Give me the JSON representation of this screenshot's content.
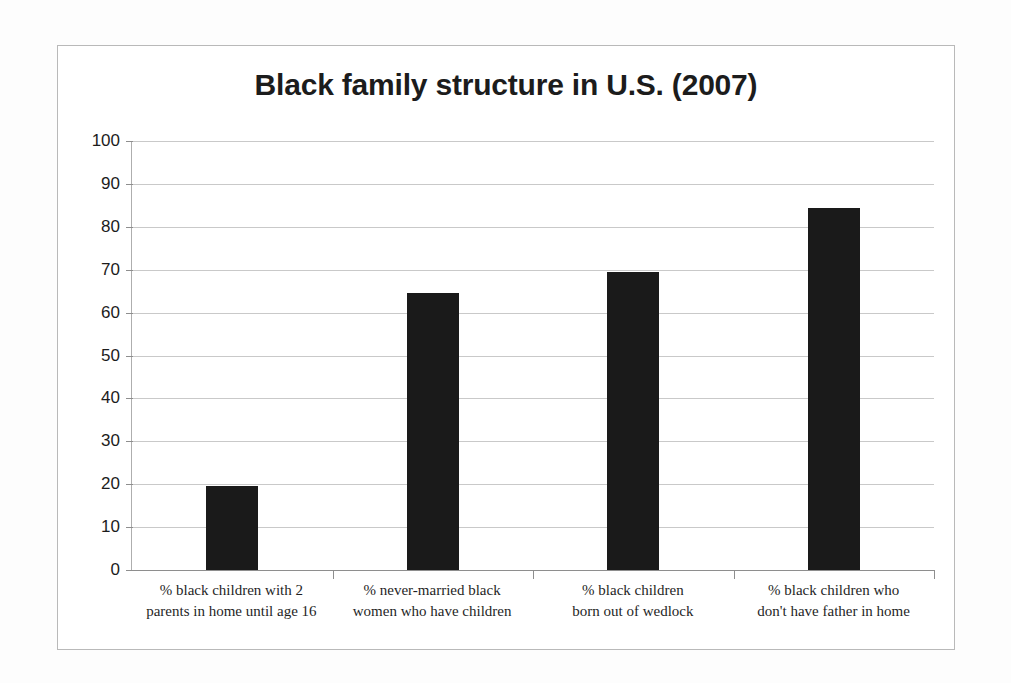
{
  "chart_data": {
    "type": "bar",
    "title": "Black family structure in U.S. (2007)",
    "xlabel": "",
    "ylabel": "",
    "ylim": [
      0,
      100
    ],
    "ytick_step": 10,
    "yticks": [
      "100",
      "90",
      "80",
      "70",
      "60",
      "50",
      "40",
      "30",
      "20",
      "10",
      "0"
    ],
    "grid": true,
    "legend": false,
    "bar_color": "#1a1a1a",
    "categories": [
      "% black children with 2 parents in home until age 16",
      "% never-married black women who have children",
      "% black children born out of wedlock",
      "% black children who don't have father in home"
    ],
    "category_lines": [
      [
        "% black children with 2",
        "parents in home until age 16"
      ],
      [
        "% never-married black",
        "women who have children"
      ],
      [
        "% black children",
        "born out of wedlock"
      ],
      [
        "% black children who",
        "don't have father in home"
      ]
    ],
    "values": [
      19.5,
      64.5,
      69.5,
      84.5
    ]
  }
}
